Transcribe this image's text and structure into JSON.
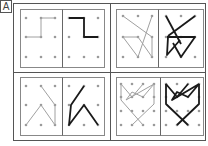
{
  "figure": {
    "label": "A",
    "colors": {
      "frame": "#555555",
      "panel_border": "#888888",
      "dot": "#9a9a9a",
      "gray_line": "#a0a0a0",
      "black_line": "#1a1a1a"
    },
    "panels": [
      {
        "id": "top-left",
        "grid": "3x3",
        "left_half_gray": [
          [
            [
              55,
              18
            ],
            [
              41,
              18
            ],
            [
              41,
              37
            ],
            [
              26,
              37
            ]
          ]
        ],
        "right_half_black": [
          [
            [
              69,
              18
            ],
            [
              84,
              18
            ],
            [
              84,
              37
            ],
            [
              98,
              37
            ]
          ]
        ]
      },
      {
        "id": "top-right",
        "grid": "3x3",
        "left_half_gray": [
          [
            [
              123,
              16
            ],
            [
              152,
              37
            ],
            [
              152,
              57
            ]
          ],
          [
            [
              152,
              16
            ],
            [
              138,
              57
            ]
          ],
          [
            [
              123,
              37
            ],
            [
              138,
              37
            ],
            [
              152,
              57
            ]
          ],
          [
            [
              123,
              37
            ],
            [
              138,
              57
            ]
          ]
        ],
        "right_half_black": [
          [
            [
              166,
              16
            ],
            [
              181,
              44
            ]
          ],
          [
            [
              195,
              16
            ],
            [
              168,
              36
            ]
          ],
          [
            [
              168,
              37
            ],
            [
              167,
              55
            ],
            [
              180,
              40
            ]
          ],
          [
            [
              167,
              37
            ],
            [
              195,
              37
            ],
            [
              181,
              57
            ],
            [
              173,
              43
            ]
          ]
        ]
      },
      {
        "id": "bottom-left",
        "grid": "3x3",
        "left_half_gray": [
          [
            [
              41,
              86
            ],
            [
              55,
              105
            ],
            [
              55,
              125
            ]
          ],
          [
            [
              26,
              125
            ],
            [
              41,
              105
            ],
            [
              55,
              125
            ]
          ]
        ],
        "right_half_black": [
          [
            [
              84,
              86
            ],
            [
              71,
              105
            ],
            [
              69,
              125
            ],
            [
              84,
              105
            ],
            [
              98,
              125
            ]
          ]
        ]
      },
      {
        "id": "bottom-right",
        "grid": "4x4",
        "left_half_gray": [
          [
            [
              121,
              84
            ],
            [
              121,
              100
            ],
            [
              143,
              125
            ]
          ],
          [
            [
              154,
              84
            ],
            [
              143,
              97
            ],
            [
              132,
              92
            ],
            [
              126,
              100
            ],
            [
              154,
              84
            ]
          ],
          [
            [
              154,
              84
            ],
            [
              154,
              104
            ],
            [
              132,
              125
            ]
          ],
          [
            [
              121,
              84
            ],
            [
              132,
              97
            ],
            [
              143,
              84
            ]
          ]
        ],
        "right_half_black": [
          [
            [
              166,
              84
            ],
            [
              166,
              104
            ],
            [
              188,
              125
            ]
          ],
          [
            [
              199,
              84
            ],
            [
              199,
              104
            ],
            [
              177,
              125
            ]
          ],
          [
            [
              166,
              84
            ],
            [
              177,
              97
            ],
            [
              188,
              84
            ]
          ],
          [
            [
              199,
              84
            ],
            [
              188,
              97
            ],
            [
              177,
              92
            ],
            [
              172,
              100
            ],
            [
              199,
              84
            ]
          ]
        ]
      }
    ]
  }
}
